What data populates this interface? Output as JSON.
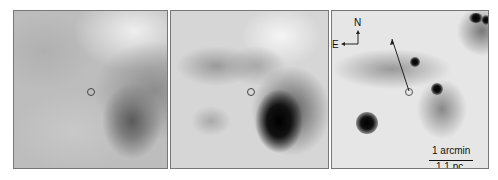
{
  "panels": [
    {
      "id": "panel-1",
      "marker": "circle"
    },
    {
      "id": "panel-2",
      "marker": "circle"
    },
    {
      "id": "panel-3",
      "marker": "circle",
      "compass": {
        "north": "N",
        "east": "E"
      },
      "scale_bar": {
        "top": "1 arcmin",
        "bottom": "1.1 pc"
      }
    }
  ]
}
